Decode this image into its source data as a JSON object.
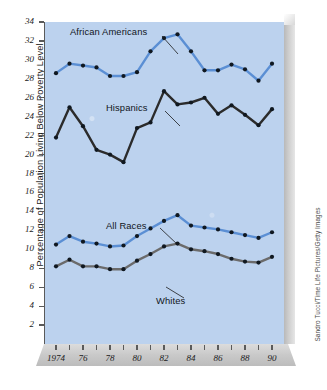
{
  "chart_data": {
    "type": "line",
    "title": "",
    "xlabel": "",
    "ylabel": "Percentage of Population Living Below Poverty Level",
    "xlim": [
      1974,
      1990
    ],
    "ylim": [
      0,
      34
    ],
    "yticks": [
      34,
      32,
      30,
      28,
      26,
      24,
      22,
      20,
      18,
      16,
      14,
      12,
      10,
      8,
      6,
      4,
      2
    ],
    "xticks": [
      1974,
      1975,
      1976,
      1977,
      1978,
      1979,
      1980,
      1981,
      1982,
      1983,
      1984,
      1985,
      1986,
      1987,
      1988,
      1989,
      1990
    ],
    "xtick_labels": [
      "1974",
      "",
      "76",
      "",
      "78",
      "",
      "80",
      "",
      "82",
      "",
      "84",
      "",
      "86",
      "",
      "88",
      "",
      "90"
    ],
    "grid": false,
    "legend_position": "inline-annotations",
    "x": [
      1974,
      1975,
      1976,
      1977,
      1978,
      1979,
      1980,
      1981,
      1982,
      1983,
      1984,
      1985,
      1986,
      1987,
      1988,
      1989,
      1990
    ],
    "series": [
      {
        "name": "African Americans",
        "color": "#5b8fd4",
        "marker_color": "#101820",
        "values": [
          28.6,
          29.6,
          29.4,
          29.2,
          28.3,
          28.3,
          28.7,
          30.9,
          32.3,
          32.7,
          30.9,
          28.9,
          28.9,
          29.5,
          29.0,
          27.8,
          29.6
        ]
      },
      {
        "name": "Hispanics",
        "color": "#2b2b2b",
        "marker_color": "#101820",
        "values": [
          21.8,
          25.0,
          23.0,
          20.5,
          20.0,
          19.2,
          22.8,
          23.4,
          26.7,
          25.3,
          25.5,
          26.0,
          24.3,
          25.2,
          24.2,
          23.1,
          24.8
        ]
      },
      {
        "name": "All Races",
        "color": "#5b8fd4",
        "marker_color": "#101820",
        "values": [
          10.5,
          11.4,
          10.8,
          10.6,
          10.3,
          10.4,
          11.4,
          12.2,
          13.0,
          13.6,
          12.5,
          12.3,
          12.1,
          11.8,
          11.5,
          11.2,
          11.8
        ]
      },
      {
        "name": "Whites",
        "color": "#6b6b6b",
        "marker_color": "#101820",
        "values": [
          8.2,
          8.9,
          8.2,
          8.2,
          7.9,
          7.9,
          8.8,
          9.5,
          10.3,
          10.6,
          10.0,
          9.8,
          9.5,
          9.0,
          8.7,
          8.6,
          9.2
        ]
      }
    ],
    "annotations": [
      {
        "name": "African Americans",
        "label": "African Americans"
      },
      {
        "name": "Hispanics",
        "label": "Hispanics"
      },
      {
        "name": "All Races",
        "label": "All Races"
      },
      {
        "name": "Whites",
        "label": "Whites"
      }
    ]
  },
  "credit": {
    "text": "Sandro Tucci/Time Life Pictures/Getty Images"
  },
  "colors": {
    "plot_background": "#bcd2ee",
    "page_background": "#ffffff",
    "blue_series": "#5b8fd4",
    "dark_series": "#2b2b2b",
    "gray_series": "#6b6b6b",
    "axis": "#5a5a5a"
  }
}
